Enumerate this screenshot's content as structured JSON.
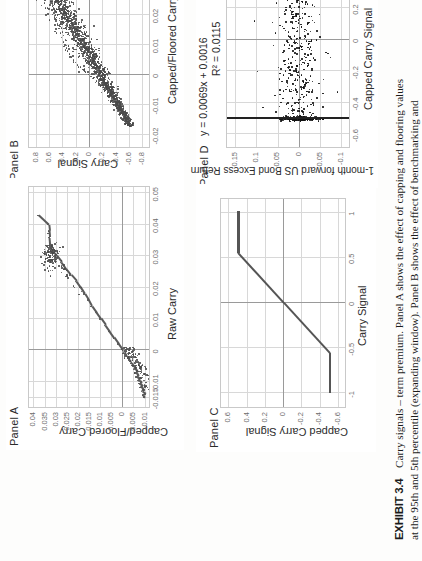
{
  "exhibit": {
    "number_label": "EXHIBIT 3.4",
    "title": "Carry signals – term premium. Panel A shows the effect of capping and flooring values at the 95th and 5th percentile (expanding window). Panel B shows the effect of benchmarking and volatility"
  },
  "panels": [
    {
      "id": "A",
      "title": "Panel A",
      "xlabel": "Raw Carry",
      "ylabel": "Capped/Floored Carry",
      "xticks": [
        "-0.015",
        "-0.01",
        "0",
        "0.01",
        "0.02",
        "0.03",
        "0.04",
        "0.05"
      ],
      "yticks": [
        "-0.01",
        "-0.005",
        "0",
        "0.005",
        "0.01",
        "0.015",
        "0.02",
        "0.025",
        "0.03",
        "0.035",
        "0.04"
      ]
    },
    {
      "id": "B",
      "title": "Panel B",
      "xlabel": "Capped/Floored Carry",
      "ylabel": "Carry Signal",
      "xticks": [
        "-0.02",
        "-0.01",
        "0",
        "0.01",
        "0.02",
        "0.03",
        "0.04"
      ],
      "yticks": [
        "-0.8",
        "-0.6",
        "-0.4",
        "-0.2",
        "0",
        "0.2",
        "0.4",
        "0.6",
        "0.8"
      ]
    },
    {
      "id": "C",
      "title": "Panel C",
      "xlabel": "Carry Signal",
      "ylabel": "Capped Carry Signal",
      "xticks": [
        "-1",
        "-0.5",
        "0",
        "0.5",
        "1"
      ],
      "yticks": [
        "-0.6",
        "-0.4",
        "-0.2",
        "0",
        "0.2",
        "0.4",
        "0.6"
      ]
    },
    {
      "id": "D",
      "title": "Panel D",
      "equation_line1": "y = 0.0069x + 0.0016",
      "equation_line2": "R² = 0.0115",
      "xlabel": "Capped Carry Signal",
      "ylabel": "1-month forward US Bond Excess Return",
      "xticks": [
        "-0.6",
        "-0.4",
        "-0.2",
        "0",
        "0.2",
        "0.4",
        "0.6"
      ],
      "yticks": [
        "-0.1",
        "-0.05",
        "0",
        "0.05",
        "0.1",
        "0.15"
      ]
    }
  ],
  "chart_data": [
    {
      "type": "scatter",
      "panel": "A",
      "title": "Panel A",
      "xlabel": "Raw Carry",
      "ylabel": "Capped/Floored Carry",
      "xlim": [
        -0.018,
        0.052
      ],
      "ylim": [
        -0.012,
        0.042
      ],
      "grid": true,
      "legend": "none",
      "description": "Identity line for mid-range values that flattens/saturates at the 95th and 5th percentile caps; a dense cluster sits near (0.032, 0.032) and a scattered cloud near the origin below zero.",
      "points": [
        [
          -0.015,
          -0.0098
        ],
        [
          -0.0142,
          -0.009
        ],
        [
          -0.0138,
          -0.0102
        ],
        [
          -0.013,
          -0.0086
        ],
        [
          -0.0124,
          -0.0094
        ],
        [
          -0.0118,
          -0.008
        ],
        [
          -0.0112,
          -0.0088
        ],
        [
          -0.0106,
          -0.0074
        ],
        [
          -0.01,
          -0.0082
        ],
        [
          -0.0096,
          -0.0068
        ],
        [
          -0.009,
          -0.0076
        ],
        [
          -0.0084,
          -0.0062
        ],
        [
          -0.0078,
          -0.007
        ],
        [
          -0.0072,
          -0.0056
        ],
        [
          -0.0066,
          -0.0064
        ],
        [
          -0.006,
          -0.005
        ],
        [
          -0.0054,
          -0.0058
        ],
        [
          -0.0048,
          -0.0044
        ],
        [
          -0.0042,
          -0.004
        ],
        [
          -0.0036,
          -0.0034
        ],
        [
          -0.003,
          -0.003
        ],
        [
          -0.0024,
          -0.0024
        ],
        [
          -0.0018,
          -0.0018
        ],
        [
          -0.0012,
          -0.0012
        ],
        [
          -0.0006,
          -0.0006
        ],
        [
          0.0,
          0.0
        ],
        [
          0.002,
          0.002
        ],
        [
          0.004,
          0.004
        ],
        [
          0.006,
          0.006
        ],
        [
          0.008,
          0.008
        ],
        [
          0.01,
          0.01
        ],
        [
          0.012,
          0.012
        ],
        [
          0.014,
          0.014
        ],
        [
          0.016,
          0.0155
        ],
        [
          0.018,
          0.0172
        ],
        [
          0.02,
          0.019
        ],
        [
          0.022,
          0.021
        ],
        [
          0.024,
          0.0235
        ],
        [
          0.026,
          0.0258
        ],
        [
          0.028,
          0.0278
        ],
        [
          0.03,
          0.03
        ],
        [
          0.031,
          0.0312
        ],
        [
          0.032,
          0.032
        ],
        [
          0.033,
          0.0325
        ],
        [
          0.034,
          0.0328
        ],
        [
          0.036,
          0.033
        ],
        [
          0.038,
          0.0332
        ],
        [
          0.04,
          0.0335
        ],
        [
          0.043,
          0.038
        ]
      ]
    },
    {
      "type": "scatter",
      "panel": "B",
      "title": "Panel B",
      "xlabel": "Capped/Floored Carry",
      "ylabel": "Carry Signal",
      "xlim": [
        -0.024,
        0.044
      ],
      "ylim": [
        -0.9,
        0.9
      ],
      "grid": true,
      "legend": "none",
      "description": "Dense, roughly linear positive relationship between capped/floored carry and the benchmarked, volatility-scaled carry signal; band widens at the upper-right with several outliers above the main band.",
      "points": [
        [
          -0.016,
          -0.66
        ],
        [
          -0.015,
          -0.62
        ],
        [
          -0.0145,
          -0.6
        ],
        [
          -0.0138,
          -0.58
        ],
        [
          -0.013,
          -0.55
        ],
        [
          -0.0125,
          -0.54
        ],
        [
          -0.0118,
          -0.5
        ],
        [
          -0.011,
          -0.48
        ],
        [
          -0.0102,
          -0.45
        ],
        [
          -0.0095,
          -0.43
        ],
        [
          -0.0088,
          -0.4
        ],
        [
          -0.008,
          -0.37
        ],
        [
          -0.0072,
          -0.34
        ],
        [
          -0.0065,
          -0.31
        ],
        [
          -0.0058,
          -0.28
        ],
        [
          -0.005,
          -0.25
        ],
        [
          -0.0042,
          -0.22
        ],
        [
          -0.0035,
          -0.18
        ],
        [
          -0.0028,
          -0.15
        ],
        [
          -0.002,
          -0.11
        ],
        [
          -0.0012,
          -0.07
        ],
        [
          -0.0005,
          -0.03
        ],
        [
          0.0002,
          0.01
        ],
        [
          0.001,
          0.05
        ],
        [
          0.0018,
          0.09
        ],
        [
          0.0026,
          0.13
        ],
        [
          0.0034,
          0.17
        ],
        [
          0.0042,
          0.2
        ],
        [
          0.005,
          0.23
        ],
        [
          0.006,
          0.26
        ],
        [
          0.007,
          0.29
        ],
        [
          0.008,
          0.32
        ],
        [
          0.009,
          0.34
        ],
        [
          0.01,
          0.36
        ],
        [
          0.011,
          0.38
        ],
        [
          0.0125,
          0.41
        ],
        [
          0.014,
          0.43
        ],
        [
          0.0155,
          0.45
        ],
        [
          0.017,
          0.47
        ],
        [
          0.0185,
          0.49
        ],
        [
          0.02,
          0.5
        ],
        [
          0.022,
          0.52
        ],
        [
          0.024,
          0.55
        ],
        [
          0.026,
          0.57
        ],
        [
          0.028,
          0.6
        ],
        [
          0.03,
          0.62
        ],
        [
          0.031,
          0.63
        ]
      ]
    },
    {
      "type": "line",
      "panel": "C",
      "title": "Panel C",
      "xlabel": "Carry Signal",
      "ylabel": "Capped Carry Signal",
      "xlim": [
        -1.15,
        1.15
      ],
      "ylim": [
        -0.68,
        0.68
      ],
      "grid": true,
      "legend": "none",
      "description": "Piecewise-linear capping transform: linear pass-through between roughly -0.55 and +0.55 of the raw carry signal, with hard flat caps at approximately +0.5 and -0.5 beyond those thresholds.",
      "x": [
        -1.0,
        -0.62,
        -0.55,
        0.0,
        0.55,
        0.62,
        1.0
      ],
      "y": [
        -0.5,
        -0.5,
        -0.5,
        0.0,
        0.5,
        0.5,
        0.5
      ]
    },
    {
      "type": "scatter",
      "panel": "D",
      "title": "Panel D",
      "xlabel": "Capped Carry Signal",
      "ylabel": "1-month forward US Bond Excess Return",
      "xlim": [
        -0.68,
        0.68
      ],
      "ylim": [
        -0.12,
        0.17
      ],
      "grid": true,
      "legend": "none",
      "fit_equation": "y = 0.0069x + 0.0016",
      "fit_r2": 0.0115,
      "fit_slope": 0.0069,
      "fit_intercept": 0.0016,
      "description": "Very weak positive relationship between the capped carry signal and the 1-month forward US bond excess return. A dense vertical column of observations sits at the caps of +0.5 and -0.5, with returns mostly between -0.05 and +0.05 and a few outliers beyond +0.1.",
      "n_points_approx": 900
    }
  ]
}
